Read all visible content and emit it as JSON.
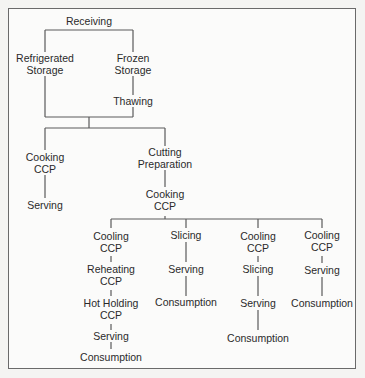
{
  "diagram": {
    "nodes": {
      "receiving": {
        "line1": "Receiving"
      },
      "refrigerated_storage": {
        "line1": "Refrigerated",
        "line2": "Storage"
      },
      "frozen_storage": {
        "line1": "Frozen",
        "line2": "Storage"
      },
      "thawing": {
        "line1": "Thawing"
      },
      "cooking_ccp_left": {
        "line1": "Cooking",
        "line2": "CCP"
      },
      "serving_left": {
        "line1": "Serving"
      },
      "cutting_preparation": {
        "line1": "Cutting",
        "line2": "Preparation"
      },
      "cooking_ccp_mid": {
        "line1": "Cooking",
        "line2": "CCP"
      },
      "b1_cooling_ccp": {
        "line1": "Cooling",
        "line2": "CCP"
      },
      "b1_reheating_ccp": {
        "line1": "Reheating",
        "line2": "CCP"
      },
      "b1_hot_holding_ccp": {
        "line1": "Hot Holding",
        "line2": "CCP"
      },
      "b1_serving": {
        "line1": "Serving"
      },
      "b1_consumption": {
        "line1": "Consumption"
      },
      "b2_slicing": {
        "line1": "Slicing"
      },
      "b2_serving": {
        "line1": "Serving"
      },
      "b2_consumption": {
        "line1": "Consumption"
      },
      "b3_cooling_ccp": {
        "line1": "Cooling",
        "line2": "CCP"
      },
      "b3_slicing": {
        "line1": "Slicing"
      },
      "b3_serving": {
        "line1": "Serving"
      },
      "b3_consumption": {
        "line1": "Consumption"
      },
      "b4_cooling_ccp": {
        "line1": "Cooling",
        "line2": "CCP"
      },
      "b4_serving": {
        "line1": "Serving"
      },
      "b4_consumption": {
        "line1": "Consumption"
      }
    },
    "edges": [
      [
        "Receiving",
        "Refrigerated Storage"
      ],
      [
        "Receiving",
        "Frozen Storage"
      ],
      [
        "Frozen Storage",
        "Thawing"
      ],
      [
        "Refrigerated Storage",
        "Cooking CCP"
      ],
      [
        "Refrigerated Storage",
        "Cutting Preparation"
      ],
      [
        "Thawing",
        "Cooking CCP"
      ],
      [
        "Thawing",
        "Cutting Preparation"
      ],
      [
        "Cooking CCP",
        "Serving"
      ],
      [
        "Cutting Preparation",
        "Cooking CCP (2)"
      ],
      [
        "Cooking CCP (2)",
        "Cooling CCP (A)"
      ],
      [
        "Cooking CCP (2)",
        "Slicing (B)"
      ],
      [
        "Cooking CCP (2)",
        "Cooling CCP (C)"
      ],
      [
        "Cooking CCP (2)",
        "Cooling CCP (D)"
      ],
      [
        "Cooling CCP (A)",
        "Reheating CCP"
      ],
      [
        "Reheating CCP",
        "Hot Holding CCP"
      ],
      [
        "Hot Holding CCP",
        "Serving (A)"
      ],
      [
        "Serving (A)",
        "Consumption (A)"
      ],
      [
        "Slicing (B)",
        "Serving (B)"
      ],
      [
        "Serving (B)",
        "Consumption (B)"
      ],
      [
        "Cooling CCP (C)",
        "Slicing (C)"
      ],
      [
        "Slicing (C)",
        "Serving (C)"
      ],
      [
        "Serving (C)",
        "Consumption (C)"
      ],
      [
        "Cooling CCP (D)",
        "Serving (D)"
      ],
      [
        "Serving (D)",
        "Consumption (D)"
      ]
    ],
    "colors": {
      "line": "#5a5a5a",
      "text": "#2a2a2a",
      "background": "#fbfbfa",
      "border": "#6a6a6a"
    }
  }
}
